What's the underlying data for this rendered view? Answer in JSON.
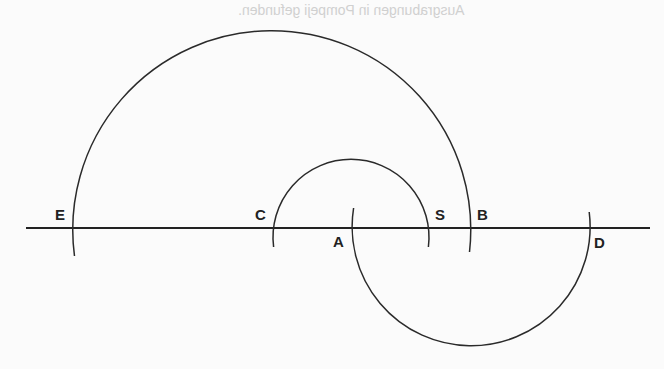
{
  "caption": "Ausgrabungen in Pompeji gefunden.",
  "labels": {
    "E": "E",
    "C": "C",
    "A": "A",
    "S": "S",
    "B": "B",
    "D": "D"
  },
  "geometry": {
    "baseline": {
      "y": 228,
      "x1": 26,
      "x2": 650
    },
    "arcs": [
      {
        "name": "large-upper-arc",
        "from": "E",
        "to": "B",
        "center_x": 271.5,
        "radius": 199,
        "side": "above"
      },
      {
        "name": "small-upper-arc",
        "from": "C",
        "to": "S",
        "center_x": 351,
        "radius": 78,
        "side": "above"
      },
      {
        "name": "lower-arc",
        "from": "A",
        "to": "D",
        "center_x": 471,
        "radius": 119,
        "side": "below"
      }
    ]
  },
  "colors": {
    "stroke": "#2a2a2a",
    "background": "#fbfbfb"
  }
}
